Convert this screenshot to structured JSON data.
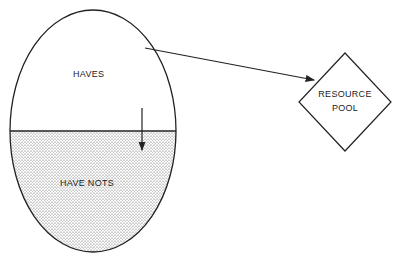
{
  "diagram": {
    "upper_region": {
      "label": "HAVES"
    },
    "lower_region": {
      "label": "HAVE NOTS"
    },
    "resource": {
      "line1": "RESOURCE",
      "line2": "POOL"
    },
    "colors": {
      "stroke": "#222222",
      "stipple": "#555555",
      "background": "#ffffff"
    }
  }
}
